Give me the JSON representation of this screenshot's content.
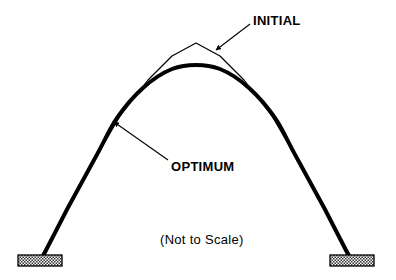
{
  "figure": {
    "type": "engineering-diagram",
    "background_color": "#ffffff",
    "line_color": "#000000",
    "width": 396,
    "height": 280
  },
  "labels": {
    "initial": "INITIAL",
    "optimum": "OPTIMUM",
    "not_to_scale": "(Not to Scale)"
  },
  "curves": {
    "initial": {
      "name": "INITIAL",
      "style": "thin",
      "stroke_width": 1.2,
      "stroke_color": "#000000",
      "apex": {
        "x": 196,
        "y": 43
      },
      "description": "pointed-apex arch outline",
      "path": "M 40,258 L 52,238 L 73,200 L 96,157 L 120,116 L 148,80 L 172,56 L 196,43 L 220,56 L 244,80 L 272,116 L 296,157 L 319,200 L 340,238 L 352,258"
    },
    "optimum": {
      "name": "OPTIMUM",
      "style": "thick",
      "stroke_width": 4.0,
      "stroke_color": "#000000",
      "apex": {
        "x": 196,
        "y": 65
      },
      "description": "rounded flatter-apex optimized arch",
      "path": "M 42,258 C 56,230 76,192 94,160 C 104,142 110,128 117,118 C 132,96 152,77 172,69 C 180,66 188,65 196,65 C 204,65 212,66 220,69 C 240,77 260,96 275,118 C 282,128 288,142 298,160 C 316,192 336,230 350,258"
    }
  },
  "leaders": {
    "initial": {
      "name": "initial-leader",
      "from": {
        "x": 250,
        "y": 24
      },
      "to": {
        "x": 216,
        "y": 50
      },
      "arrowhead_at": "to"
    },
    "optimum": {
      "name": "optimum-leader",
      "from": {
        "x": 168,
        "y": 160
      },
      "to": {
        "x": 114,
        "y": 122
      },
      "arrowhead_at": "to"
    }
  },
  "supports": [
    {
      "name": "left-support",
      "x": 18,
      "y": 255,
      "width": 44,
      "height": 11,
      "fill": "hatched",
      "outline_color": "#000000"
    },
    {
      "name": "right-support",
      "x": 330,
      "y": 255,
      "width": 44,
      "height": 11,
      "fill": "hatched",
      "outline_color": "#000000"
    }
  ]
}
